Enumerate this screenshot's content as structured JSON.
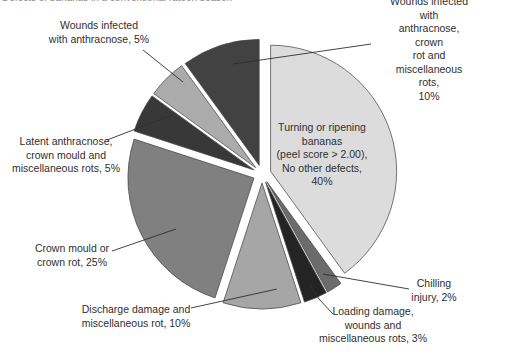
{
  "figure": {
    "background": "#ffffff",
    "text_color": "#2f2f2f",
    "clipped_caption": "Defects of bananas in a conventional ratoon season"
  },
  "chart_data": {
    "type": "pie",
    "variant": "exploded",
    "unit": "%",
    "direction": "clockwise",
    "start_angle_deg": 0,
    "legend": "none — direct callout labels with leader lines",
    "grid": "off",
    "center_px": [
      262,
      174
    ],
    "radius_px": 126,
    "explode_px": 9,
    "outline_color": "#4a4a4a",
    "leader_color": "#2f2f2f",
    "slices": [
      {
        "key": "turning-ripening",
        "label": "Turning or ripening bananas (peel score > 2.00), No other defects",
        "value": 40,
        "color": "#dcdcdc",
        "display": "Turning or ripening\nbananas\n(peel score > 2.00),\nNo other defects,\n40%"
      },
      {
        "key": "chilling-injury",
        "label": "Chilling injury",
        "value": 2,
        "color": "#6b6b6b",
        "display": "Chilling\ninjury, 2%"
      },
      {
        "key": "loading-damage",
        "label": "Loading damage, wounds and miscellaneous rots",
        "value": 3,
        "color": "#242424",
        "display": "Loading damage,\nwounds and\nmiscellaneous rots, 3%"
      },
      {
        "key": "discharge-damage",
        "label": "Discharge damage and miscellaneous rot",
        "value": 10,
        "color": "#a6a6a6",
        "display": "Discharge damage and\nmiscellaneous rot, 10%"
      },
      {
        "key": "crown-mould",
        "label": "Crown mould or crown rot",
        "value": 25,
        "color": "#808080",
        "display": "Crown mould or\ncrown rot, 25%"
      },
      {
        "key": "latent-anthracnose",
        "label": "Latent anthracnose, crown mould and miscellaneous rots",
        "value": 5,
        "color": "#383838",
        "display": "Latent anthracnose,\ncrown mould and\nmiscellaneous rots, 5%"
      },
      {
        "key": "wounds-anthracnose",
        "label": "Wounds infected with anthracnose",
        "value": 5,
        "color": "#ababab",
        "display": "Wounds infected\nwith anthracnose, 5%"
      },
      {
        "key": "wounds-anthracnose-crown-rot",
        "label": "Wounds infected with anthracnose, crown rot and miscellaneous rots",
        "value": 10,
        "color": "#424242",
        "display": "Wounds infected with\nanthracnose, crown\nrot and miscellaneous rots,\n10%"
      }
    ]
  }
}
